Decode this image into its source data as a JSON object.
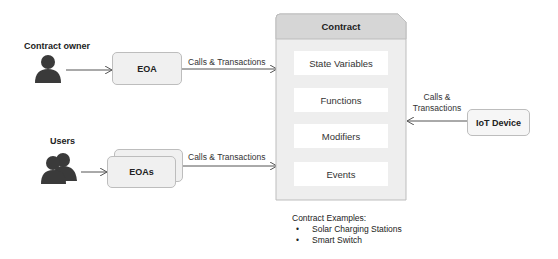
{
  "actors": {
    "owner": {
      "label": "Contract owner",
      "icon": "person-icon"
    },
    "users": {
      "label": "Users",
      "icon": "users-icon"
    }
  },
  "accounts": {
    "eoa": {
      "label": "EOA"
    },
    "eoas": {
      "label": "EOAs"
    },
    "iot": {
      "label": "IoT Device"
    }
  },
  "edges": {
    "owner_to_contract": "Calls & Transactions",
    "users_to_contract": "Calls & Transactions",
    "iot_to_contract_line1": "Calls &",
    "iot_to_contract_line2": "Transactions"
  },
  "contract": {
    "title": "Contract",
    "sections": [
      "State Variables",
      "Functions",
      "Modifiers",
      "Events"
    ]
  },
  "examples": {
    "heading": "Contract Examples:",
    "items": [
      "Solar Charging Stations",
      "Smart Switch"
    ]
  },
  "colors": {
    "icon": "#3a3a3a",
    "box_fill": "#f0f0f0",
    "box_border": "#bdbdbd",
    "contract_header": "#d6d6d6",
    "contract_body": "#eeeeee",
    "line": "#555555"
  }
}
